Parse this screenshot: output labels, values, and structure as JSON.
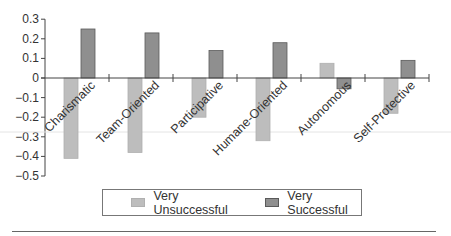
{
  "chart_data": {
    "type": "bar",
    "title": "",
    "xlabel": "",
    "ylabel": "",
    "categories": [
      "Charismatic",
      "Team-Oriented",
      "Participative",
      "Humane-Oriented",
      "Autonomous",
      "Self-Protective"
    ],
    "series": [
      {
        "name": "Very Unsuccessful",
        "color": "#bdbdbd",
        "values": [
          -0.41,
          -0.38,
          -0.2,
          -0.32,
          0.075,
          -0.18
        ]
      },
      {
        "name": "Very Successful",
        "color": "#8f8f8f",
        "values": [
          0.25,
          0.23,
          0.14,
          0.18,
          -0.055,
          0.09
        ]
      }
    ],
    "ylim": [
      -0.5,
      0.3
    ],
    "yticks": [
      0.3,
      0.2,
      0.1,
      0,
      -0.1,
      -0.2,
      -0.3,
      -0.4,
      -0.5
    ],
    "ytick_labels": [
      "0.3",
      "0.2",
      "0.1",
      "0",
      "−0.1",
      "−0.2",
      "−0.3",
      "−0.4",
      "−0.5"
    ],
    "grid": false,
    "legend_position": "bottom"
  },
  "legend": {
    "items": [
      {
        "label": "Very Unsuccessful",
        "color": "#bdbdbd"
      },
      {
        "label": "Very Successful",
        "color": "#8f8f8f"
      }
    ]
  }
}
